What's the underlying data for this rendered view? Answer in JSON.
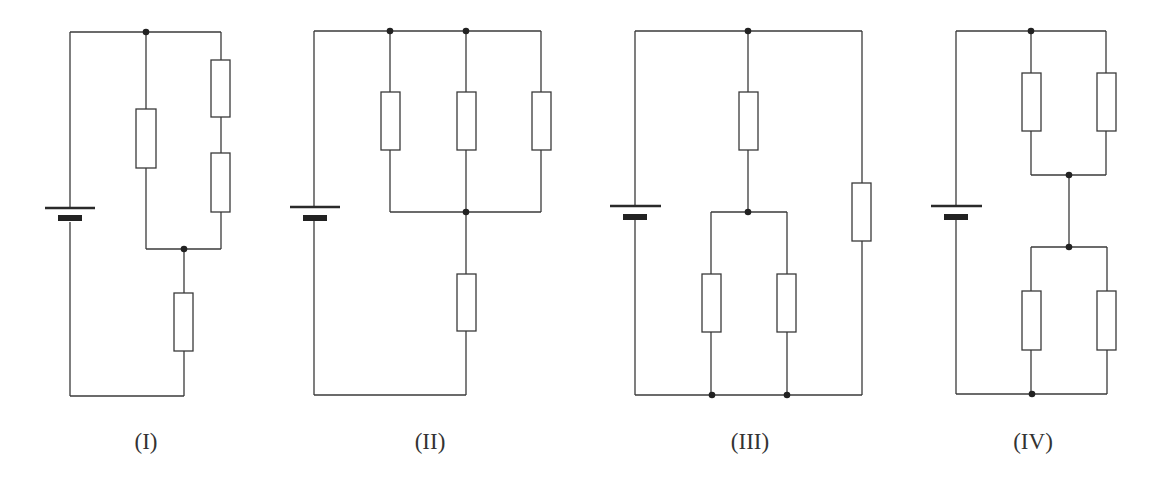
{
  "figure": {
    "colors": {
      "line": "#3a3a3a",
      "node": "#222222",
      "background": "#ffffff"
    },
    "circuits": [
      {
        "id": "I",
        "label": "(I)",
        "label_pos": [
          146,
          449
        ],
        "wires": [
          [
            [
              70,
              32
            ],
            [
              221,
              32
            ]
          ],
          [
            [
              70,
              32
            ],
            [
              70,
              208
            ]
          ],
          [
            [
              70,
              222
            ],
            [
              70,
              396
            ]
          ],
          [
            [
              70,
              396
            ],
            [
              184,
              396
            ]
          ],
          [
            [
              146,
              32
            ],
            [
              146,
              109
            ]
          ],
          [
            [
              146,
              168
            ],
            [
              146,
              249
            ]
          ],
          [
            [
              146,
              249
            ],
            [
              221,
              249
            ]
          ],
          [
            [
              221,
              32
            ],
            [
              221,
              60
            ]
          ],
          [
            [
              221,
              117
            ],
            [
              221,
              153
            ]
          ],
          [
            [
              221,
              212
            ],
            [
              221,
              249
            ]
          ],
          [
            [
              184,
              249
            ],
            [
              184,
              293
            ]
          ],
          [
            [
              184,
              351
            ],
            [
              184,
              396
            ]
          ]
        ],
        "resistors": [
          [
            136,
            109,
            20,
            59
          ],
          [
            211,
            60,
            19,
            57
          ],
          [
            211,
            153,
            19,
            59
          ],
          [
            174,
            293,
            19,
            58
          ]
        ],
        "nodes": [
          [
            146,
            32
          ],
          [
            184,
            249
          ]
        ],
        "battery": {
          "x": 70,
          "long": [
            45,
            95,
            208
          ],
          "short": [
            58,
            82,
            218
          ]
        }
      },
      {
        "id": "II",
        "label": "(II)",
        "label_pos": [
          430,
          449
        ],
        "wires": [
          [
            [
              314,
              31
            ],
            [
              541,
              31
            ]
          ],
          [
            [
              314,
              31
            ],
            [
              314,
              207
            ]
          ],
          [
            [
              314,
              221
            ],
            [
              314,
              395
            ]
          ],
          [
            [
              314,
              395
            ],
            [
              466,
              395
            ]
          ],
          [
            [
              390,
              31
            ],
            [
              390,
              92
            ]
          ],
          [
            [
              390,
              150
            ],
            [
              390,
              212
            ]
          ],
          [
            [
              466,
              31
            ],
            [
              466,
              92
            ]
          ],
          [
            [
              466,
              150
            ],
            [
              466,
              274
            ]
          ],
          [
            [
              466,
              331
            ],
            [
              466,
              395
            ]
          ],
          [
            [
              541,
              31
            ],
            [
              541,
              92
            ]
          ],
          [
            [
              541,
              150
            ],
            [
              541,
              212
            ]
          ],
          [
            [
              390,
              212
            ],
            [
              541,
              212
            ]
          ]
        ],
        "resistors": [
          [
            381,
            92,
            19,
            58
          ],
          [
            457,
            92,
            19,
            58
          ],
          [
            532,
            92,
            19,
            58
          ],
          [
            457,
            274,
            19,
            57
          ]
        ],
        "nodes": [
          [
            390,
            31
          ],
          [
            466,
            31
          ],
          [
            466,
            212
          ]
        ],
        "battery": {
          "x": 314,
          "long": [
            290,
            340,
            207
          ],
          "short": [
            303,
            327,
            218
          ]
        }
      },
      {
        "id": "III",
        "label": "(III)",
        "label_pos": [
          750,
          449
        ],
        "wires": [
          [
            [
              635,
              31
            ],
            [
              862,
              31
            ]
          ],
          [
            [
              635,
              31
            ],
            [
              635,
              206
            ]
          ],
          [
            [
              635,
              220
            ],
            [
              635,
              395
            ]
          ],
          [
            [
              635,
              395
            ],
            [
              862,
              395
            ]
          ],
          [
            [
              748,
              31
            ],
            [
              748,
              92
            ]
          ],
          [
            [
              748,
              150
            ],
            [
              748,
              212
            ]
          ],
          [
            [
              711,
              212
            ],
            [
              787,
              212
            ]
          ],
          [
            [
              711,
              212
            ],
            [
              711,
              274
            ]
          ],
          [
            [
              711,
              332
            ],
            [
              711,
              395
            ]
          ],
          [
            [
              787,
              212
            ],
            [
              787,
              274
            ]
          ],
          [
            [
              787,
              332
            ],
            [
              787,
              395
            ]
          ],
          [
            [
              862,
              31
            ],
            [
              862,
              183
            ]
          ],
          [
            [
              862,
              241
            ],
            [
              862,
              395
            ]
          ]
        ],
        "resistors": [
          [
            739,
            92,
            19,
            58
          ],
          [
            702,
            274,
            19,
            58
          ],
          [
            777,
            274,
            19,
            58
          ],
          [
            852,
            183,
            19,
            58
          ]
        ],
        "nodes": [
          [
            748,
            31
          ],
          [
            748,
            212
          ],
          [
            712,
            395
          ],
          [
            787,
            395
          ]
        ],
        "battery": {
          "x": 635,
          "long": [
            610,
            661,
            206
          ],
          "short": [
            623,
            647,
            217
          ]
        }
      },
      {
        "id": "IV",
        "label": "(IV)",
        "label_pos": [
          1033,
          449
        ],
        "wires": [
          [
            [
              956,
              31
            ],
            [
              1106,
              31
            ]
          ],
          [
            [
              956,
              31
            ],
            [
              956,
              206
            ]
          ],
          [
            [
              956,
              220
            ],
            [
              956,
              394
            ]
          ],
          [
            [
              956,
              394
            ],
            [
              1107,
              394
            ]
          ],
          [
            [
              1031,
              31
            ],
            [
              1031,
              73
            ]
          ],
          [
            [
              1031,
              131
            ],
            [
              1031,
              175
            ]
          ],
          [
            [
              1106,
              31
            ],
            [
              1106,
              73
            ]
          ],
          [
            [
              1106,
              131
            ],
            [
              1106,
              175
            ]
          ],
          [
            [
              1031,
              175
            ],
            [
              1106,
              175
            ]
          ],
          [
            [
              1069,
              175
            ],
            [
              1069,
              247
            ]
          ],
          [
            [
              1031,
              247
            ],
            [
              1107,
              247
            ]
          ],
          [
            [
              1031,
              247
            ],
            [
              1031,
              291
            ]
          ],
          [
            [
              1031,
              350
            ],
            [
              1031,
              394
            ]
          ],
          [
            [
              1107,
              247
            ],
            [
              1107,
              291
            ]
          ],
          [
            [
              1107,
              350
            ],
            [
              1107,
              394
            ]
          ]
        ],
        "resistors": [
          [
            1022,
            73,
            19,
            58
          ],
          [
            1097,
            73,
            19,
            58
          ],
          [
            1022,
            291,
            19,
            59
          ],
          [
            1097,
            291,
            19,
            59
          ]
        ],
        "nodes": [
          [
            1031,
            31
          ],
          [
            1069,
            175
          ],
          [
            1069,
            247
          ],
          [
            1032,
            394
          ]
        ],
        "battery": {
          "x": 956,
          "long": [
            931,
            982,
            206
          ],
          "short": [
            944,
            968,
            217
          ]
        }
      }
    ]
  }
}
